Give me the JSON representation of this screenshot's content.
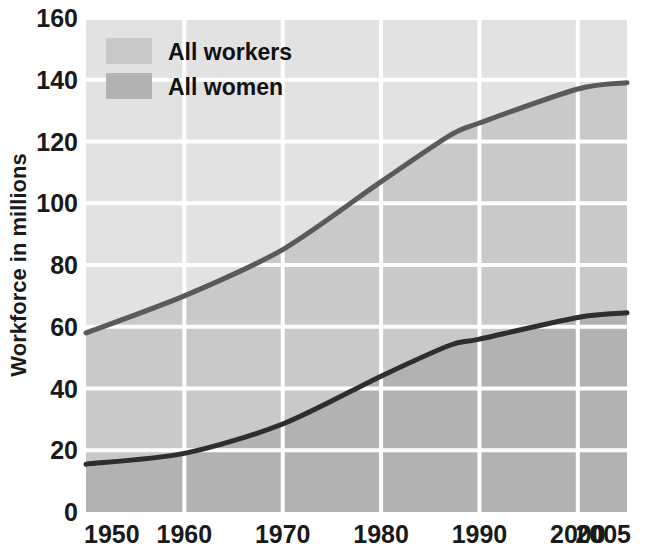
{
  "chart_data": {
    "type": "area",
    "title": "",
    "xlabel": "",
    "ylabel": "Workforce in millions",
    "xlim": [
      1950,
      2005
    ],
    "ylim": [
      0,
      160
    ],
    "ytick_step": 20,
    "grid": true,
    "legend_position": "top-left",
    "x": [
      1950,
      1960,
      1970,
      1980,
      1987,
      1990,
      2000,
      2005
    ],
    "xticks": [
      "1950",
      "1960",
      "1970",
      "1980",
      "1990",
      "2000",
      "2005"
    ],
    "xtick_values": [
      1950,
      1960,
      1970,
      1980,
      1990,
      2000,
      2005
    ],
    "yticks": [
      "0",
      "20",
      "40",
      "60",
      "80",
      "100",
      "120",
      "140",
      "160"
    ],
    "ytick_values": [
      0,
      20,
      40,
      60,
      80,
      100,
      120,
      140,
      160
    ],
    "series": [
      {
        "name": "All workers",
        "color": "#c9c9c9",
        "line_color": "#5a5a5a",
        "values": [
          58,
          70,
          85,
          107,
          122,
          126,
          137,
          139
        ]
      },
      {
        "name": "All women",
        "color": "#b2b2b2",
        "line_color": "#2e2e2e",
        "values": [
          15.5,
          19,
          28.5,
          44,
          54,
          56,
          63,
          64.5
        ]
      }
    ]
  },
  "legend": {
    "items": [
      {
        "label": "All workers",
        "swatch_color": "#c9c9c9"
      },
      {
        "label": "All women",
        "swatch_color": "#b2b2b2"
      }
    ]
  },
  "axes": {
    "y_title": "Workforce in millions"
  },
  "colors": {
    "plot_background": "#e2e2e2",
    "band_workers": "#c9c9c9",
    "band_women": "#b2b2b2",
    "gridline": "#ffffff",
    "line_workers": "#5a5a5a",
    "line_women": "#2e2e2e",
    "text": "#111111",
    "page_background": "#ffffff"
  }
}
